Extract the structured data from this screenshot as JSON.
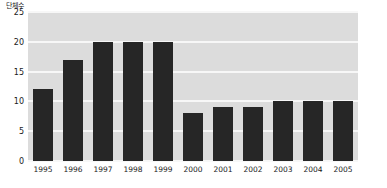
{
  "chart_data": {
    "type": "bar",
    "title": "",
    "subtitle": "",
    "xlabel": "",
    "ylabel": "단체수",
    "ylim": [
      0,
      25
    ],
    "ytick_labels": [
      "0",
      "5",
      "10",
      "15",
      "20",
      "25"
    ],
    "ytick_values": [
      0,
      5,
      10,
      15,
      20,
      25
    ],
    "grid": true,
    "legend": "none",
    "bar_color": "#262626",
    "plot_background": "#dcdcdc",
    "gridline_color": "#f7f7f7",
    "categories": [
      "1995",
      "1996",
      "1997",
      "1998",
      "1999",
      "2000",
      "2001",
      "2002",
      "2003",
      "2004",
      "2005"
    ],
    "values": [
      12,
      17,
      20,
      20,
      20,
      8,
      9,
      9,
      10,
      10,
      10
    ]
  }
}
